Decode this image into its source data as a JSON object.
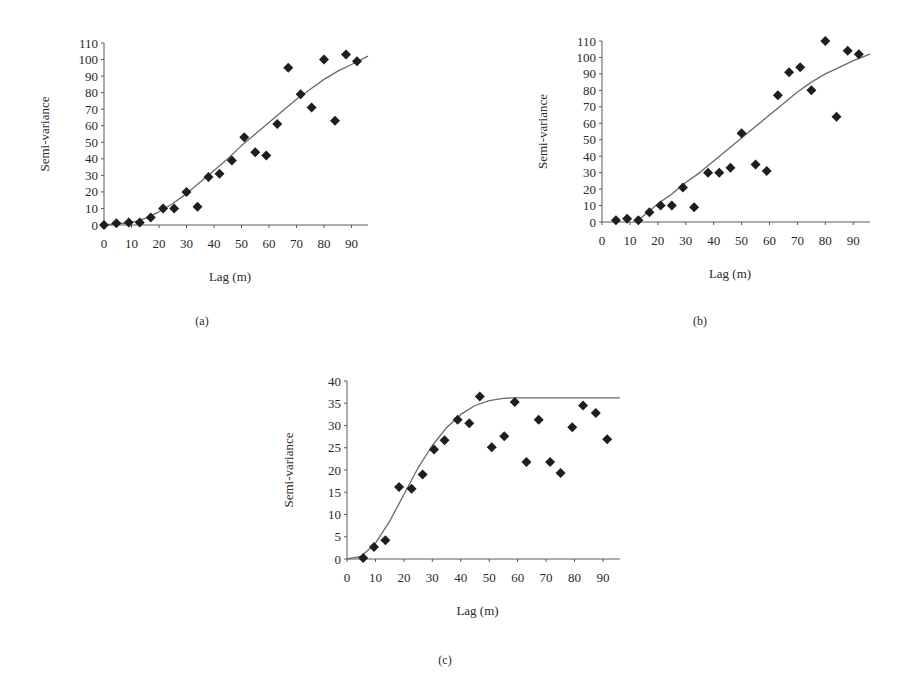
{
  "chart_data": [
    {
      "id": "a",
      "type": "scatter",
      "caption": "(a)",
      "xlabel": "Lag (m)",
      "ylabel": "Semi-variance",
      "xlim": [
        0,
        96
      ],
      "ylim": [
        0,
        110
      ],
      "xticks": [
        0,
        10,
        20,
        30,
        40,
        50,
        60,
        70,
        80,
        90
      ],
      "yticks": [
        0,
        10,
        20,
        30,
        40,
        50,
        60,
        70,
        80,
        90,
        100,
        110
      ],
      "grid": false,
      "legend": null,
      "series": [
        {
          "name": "Experimental semi-variance",
          "style": "diamond-markers",
          "x": [
            0,
            4.5,
            9,
            13,
            17,
            21.5,
            25.5,
            30,
            34,
            38,
            42,
            46.5,
            51,
            55,
            59,
            63,
            67,
            71.5,
            75.5,
            80,
            84,
            88,
            92
          ],
          "y": [
            0,
            1,
            1.5,
            1.5,
            4.5,
            10,
            10,
            20,
            11,
            29,
            31,
            39,
            53,
            44,
            42,
            61,
            95,
            79,
            71,
            100,
            63,
            103,
            99
          ]
        },
        {
          "name": "Fitted model",
          "style": "line",
          "x": [
            0,
            10,
            15,
            20,
            25,
            30,
            35,
            40,
            45,
            50,
            55,
            60,
            65,
            70,
            75,
            80,
            85,
            90,
            96
          ],
          "y": [
            0,
            1.5,
            4,
            8,
            13,
            19,
            26,
            33,
            40,
            48,
            55,
            62,
            69,
            76,
            82,
            88,
            93,
            97,
            102
          ]
        }
      ]
    },
    {
      "id": "b",
      "type": "scatter",
      "caption": "(b)",
      "xlabel": "Lag (m)",
      "ylabel": "Semi-variance",
      "xlim": [
        0,
        96
      ],
      "ylim": [
        0,
        110
      ],
      "xticks": [
        0,
        10,
        20,
        30,
        40,
        50,
        60,
        70,
        80,
        90
      ],
      "yticks": [
        0,
        10,
        20,
        30,
        40,
        50,
        60,
        70,
        80,
        90,
        100,
        110
      ],
      "grid": false,
      "legend": null,
      "series": [
        {
          "name": "Experimental semi-variance",
          "style": "diamond-markers",
          "x": [
            5,
            9,
            13,
            17,
            21,
            25,
            29,
            33,
            38,
            42,
            46,
            50,
            55,
            59,
            63,
            67,
            71,
            75,
            80,
            84,
            88,
            92
          ],
          "y": [
            1,
            2,
            1,
            6,
            10,
            10,
            21,
            9,
            30,
            30,
            33,
            54,
            35,
            31,
            77,
            91,
            94,
            80,
            110,
            64,
            104,
            102
          ]
        },
        {
          "name": "Fitted model",
          "style": "line",
          "x": [
            12,
            15,
            20,
            25,
            30,
            35,
            40,
            45,
            50,
            55,
            60,
            65,
            70,
            75,
            80,
            85,
            90,
            96
          ],
          "y": [
            0,
            4,
            11,
            17,
            24,
            30,
            37,
            44,
            51,
            58,
            65,
            72,
            79,
            85,
            90,
            94,
            98,
            102
          ]
        }
      ]
    },
    {
      "id": "c",
      "type": "scatter",
      "caption": "(c)",
      "xlabel": "Lag (m)",
      "ylabel": "Semi-variance",
      "xlim": [
        0,
        96
      ],
      "ylim": [
        0,
        40
      ],
      "xticks": [
        0,
        10,
        20,
        30,
        40,
        50,
        60,
        70,
        80,
        90
      ],
      "yticks": [
        0,
        5,
        10,
        15,
        20,
        25,
        30,
        35,
        40
      ],
      "grid": false,
      "legend": null,
      "series": [
        {
          "name": "Experimental semi-variance",
          "style": "diamond-markers",
          "x": [
            5.7,
            9.5,
            13.5,
            18.3,
            22.7,
            26.6,
            30.6,
            34.3,
            38.9,
            43,
            46.7,
            50.9,
            55.3,
            59,
            63.1,
            67.4,
            71.4,
            75.1,
            79.2,
            83,
            87.5,
            91.5
          ],
          "y": [
            0.2,
            2.7,
            4.2,
            16.2,
            15.8,
            19,
            24.6,
            26.7,
            31.3,
            30.5,
            36.5,
            25.1,
            27.6,
            35.3,
            21.8,
            31.3,
            21.8,
            19.3,
            29.6,
            34.5,
            32.8,
            26.9
          ]
        },
        {
          "name": "Fitted model",
          "style": "line",
          "x": [
            0,
            5,
            10,
            15,
            20,
            25,
            30,
            35,
            40,
            45,
            50,
            55,
            58,
            96
          ],
          "y": [
            0,
            0.6,
            3.5,
            8.5,
            14.5,
            20.5,
            25.5,
            29.5,
            32.5,
            34.5,
            35.6,
            36.1,
            36.2,
            36.2
          ]
        }
      ]
    }
  ],
  "layout": {
    "panels": [
      {
        "id": "a",
        "left": 104,
        "right": 368,
        "top": 43,
        "bottom": 225,
        "xmax": 96,
        "ymax": 110,
        "label_x": 49
      },
      {
        "id": "b",
        "left": 602,
        "right": 870,
        "top": 41,
        "bottom": 222,
        "xmax": 96,
        "ymax": 110,
        "label_x": 547
      },
      {
        "id": "c",
        "left": 347,
        "right": 620,
        "top": 381,
        "bottom": 559,
        "xmax": 96,
        "ymax": 40,
        "label_x": 293
      }
    ],
    "marker_color": "#1e1e1e",
    "line_color": "#6a6a6a",
    "axis_color": "#5a5a5a"
  }
}
